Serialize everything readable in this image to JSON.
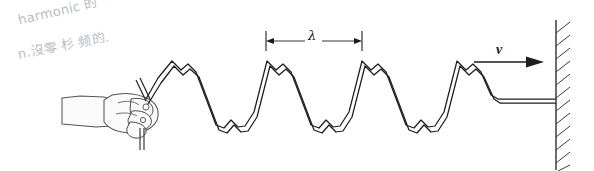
{
  "figure": {
    "background_color": "#ffffff",
    "stroke_color": "#1d1d1d",
    "annotation_color": "#b9bcc6",
    "width": 594,
    "height": 171
  },
  "annotations": {
    "handwritten_line1": "harmonic 的",
    "handwritten_line2": "n.沒零   杉 频的.",
    "footer_note": ""
  },
  "labels": {
    "wavelength": "λ",
    "velocity": "v"
  },
  "wave": {
    "kind": "rope-transverse-wave",
    "crest_count": 4,
    "baseline_y": 103,
    "crest_y": 63,
    "trough_y": 131,
    "wave_start_x": 152,
    "flat_start_x": 488,
    "wall_x": 556,
    "wavelength_px": 95,
    "notes": "Each crest carries a small secondary notch on its right flank; each trough carries a small secondary bump."
  },
  "wavelength_marker": {
    "name": "lambda-dimension",
    "left_x": 265,
    "right_x": 362,
    "y": 41,
    "tick_top_y": 31,
    "tick_bottom_y": 51
  },
  "velocity_arrow": {
    "name": "velocity-arrow",
    "tail_x": 474,
    "head_x": 542,
    "y": 62,
    "direction": "right"
  },
  "wall": {
    "name": "fixed-wall",
    "x": 556,
    "top_y": 20,
    "bottom_y": 168,
    "hatch_count": 11,
    "hatch_side": "right"
  },
  "hand": {
    "name": "hand-gripping-rope",
    "description": "Right hand and forearm entering from the left, fingers closed around the end of the rope",
    "fill": "#fbfbfb",
    "outline": "#4c4c4c"
  }
}
